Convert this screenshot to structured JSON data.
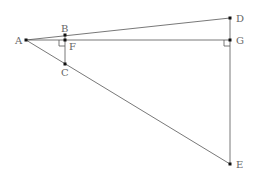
{
  "diagram": {
    "points": {
      "A": {
        "label": "A",
        "x": 26,
        "y": 40
      },
      "B": {
        "label": "B",
        "x": 65,
        "y": 35
      },
      "F": {
        "label": "F",
        "x": 65,
        "y": 40
      },
      "C": {
        "label": "C",
        "x": 65,
        "y": 64
      },
      "D": {
        "label": "D",
        "x": 230,
        "y": 18
      },
      "G": {
        "label": "G",
        "x": 230,
        "y": 40
      },
      "E": {
        "label": "E",
        "x": 230,
        "y": 164
      }
    },
    "segments": [
      [
        "A",
        "D"
      ],
      [
        "A",
        "G"
      ],
      [
        "A",
        "E"
      ],
      [
        "B",
        "C"
      ],
      [
        "D",
        "E"
      ]
    ],
    "right_angles": [
      "F",
      "G"
    ],
    "colors": {
      "line": "#555555",
      "point": "#111111",
      "label": "#666666"
    }
  }
}
